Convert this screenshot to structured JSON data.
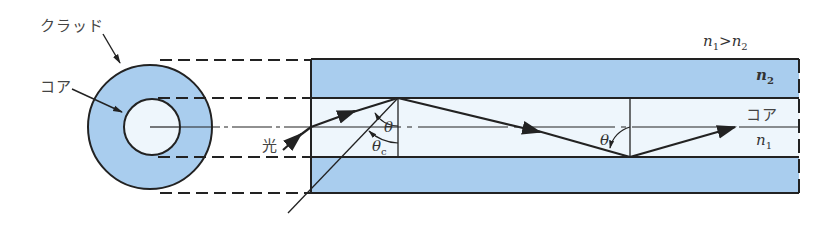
{
  "diagram": {
    "labels": {
      "cladding": "クラッド",
      "core_cross_section": "コア",
      "light": "光",
      "core_side": "コア",
      "theta": "θ",
      "theta_c": "θ",
      "theta_c_sub": "c",
      "theta_2": "θ",
      "n2": "n",
      "n2_sub": "2",
      "n1": "n",
      "n1_sub": "1",
      "condition_n1": "n",
      "condition_n1_sub": "1",
      "condition_op": ">",
      "condition_n2": "n",
      "condition_n2_sub": "2"
    },
    "colors": {
      "cladding": "#a9cdee",
      "core": "#eef6fc",
      "line": "#222222",
      "background": "#ffffff"
    }
  }
}
